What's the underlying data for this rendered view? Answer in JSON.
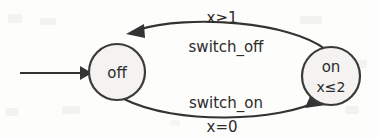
{
  "diagram": {
    "type": "timed-automaton-state-machine",
    "background_color": "#fdfdfb",
    "stroke_color": "#333333",
    "node_fill_color": "#f4f3f1",
    "text_color": "#2b2b2b",
    "states": [
      {
        "id": "off",
        "label": "off",
        "invariant": "",
        "initial": true,
        "cx": 117,
        "cy": 72,
        "r": 28
      },
      {
        "id": "on",
        "label": "on",
        "invariant": "x≤2",
        "initial": false,
        "cx": 331,
        "cy": 76,
        "r": 29
      }
    ],
    "transitions": [
      {
        "id": "on-to-off",
        "from": "on",
        "to": "off",
        "guard": "x≥1",
        "event": "switch_off",
        "guard_position": "above-curve",
        "event_position": "below-curve"
      },
      {
        "id": "off-to-on",
        "from": "off",
        "to": "on",
        "guard": "x=0",
        "event": "switch_on",
        "guard_position": "below-curve",
        "event_position": "above-curve"
      }
    ],
    "initial_arrow": {
      "label": "",
      "x_start": 20,
      "x_end": 88,
      "y": 73
    }
  }
}
